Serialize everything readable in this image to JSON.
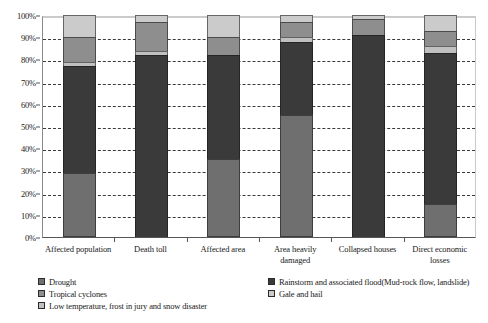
{
  "chart_data": {
    "type": "bar",
    "stacked": true,
    "title": "",
    "subtitle": "",
    "xlabel": "",
    "ylabel": "",
    "ylim": [
      0,
      100
    ],
    "ytick_labels": [
      "0%",
      "10%",
      "20%",
      "30%",
      "40%",
      "50%",
      "60%",
      "70%",
      "80%",
      "90%",
      "100%"
    ],
    "ytick_values": [
      0,
      10,
      20,
      30,
      40,
      50,
      60,
      70,
      80,
      90,
      100
    ],
    "grid": true,
    "grid_style": "dashed-horizontal",
    "legend_position": "bottom",
    "categories": [
      "Affected population",
      "Death toll",
      "Affected area",
      "Area heavily damaged",
      "Collapsed houses",
      "Direct economic losses"
    ],
    "series": [
      {
        "name": "Drought",
        "color": "#6f6f6f",
        "values": [
          29,
          0,
          35,
          55,
          0,
          15
        ]
      },
      {
        "name": "Rainstorm and associated flood(Mud-rock flow, landslide)",
        "color": "#3a3a3a",
        "values": [
          48,
          82,
          47,
          33,
          91,
          68
        ]
      },
      {
        "name": "Low temperature, frost in jury and snow disaster",
        "color": "#c0c0c0",
        "values": [
          2,
          2,
          0,
          2,
          0,
          3
        ]
      },
      {
        "name": "Tropical cyclones",
        "color": "#8e8e8e",
        "values": [
          11,
          13,
          8,
          7,
          7,
          7
        ]
      },
      {
        "name": "Gale and hail",
        "color": "#cbcbcb",
        "values": [
          10,
          3,
          10,
          3,
          2,
          7
        ]
      }
    ],
    "stack_order": [
      "Drought",
      "Rainstorm and associated flood(Mud-rock flow, landslide)",
      "Low temperature, frost in jury and snow disaster",
      "Tropical cyclones",
      "Gale and hail"
    ]
  },
  "legend": {
    "left_column": [
      {
        "label": "Drought",
        "color": "#6f6f6f"
      },
      {
        "label": "Tropical cyclones",
        "color": "#8e8e8e"
      },
      {
        "label": "Low temperature, frost in jury and snow disaster",
        "color": "#c0c0c0"
      }
    ],
    "right_column": [
      {
        "label": "Rainstorm and associated flood(Mud-rock flow, landslide)",
        "color": "#3a3a3a"
      },
      {
        "label": "Gale and hail",
        "color": "#cbcbcb"
      }
    ]
  }
}
